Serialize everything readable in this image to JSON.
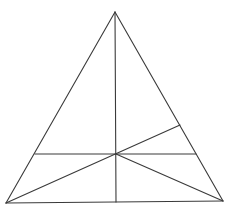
{
  "figure": {
    "stroke_color": "#3a3a3a",
    "background_color": "#ffffff",
    "points": {
      "apex": [
        115,
        12
      ],
      "bottom_left": [
        6,
        203
      ],
      "bottom_right": [
        223,
        201
      ],
      "center": [
        116,
        154
      ],
      "vertical_foot": [
        116,
        202
      ],
      "horizontal_left": [
        35,
        154
      ],
      "horizontal_right": [
        196,
        154
      ],
      "upper_right_on_side": [
        180,
        125
      ]
    },
    "segments": [
      {
        "name": "left-side",
        "from": "apex",
        "to": "bottom_left"
      },
      {
        "name": "right-side",
        "from": "apex",
        "to": "bottom_right"
      },
      {
        "name": "base",
        "from": "bottom_left",
        "to": "bottom_right"
      },
      {
        "name": "vertical-median",
        "from": "apex",
        "to": "vertical_foot"
      },
      {
        "name": "horizontal-segment",
        "from": "horizontal_left",
        "to": "horizontal_right"
      },
      {
        "name": "diagonal-bottom-left-to-right-side",
        "from": "bottom_left",
        "to": "upper_right_on_side"
      },
      {
        "name": "diagonal-center-to-bottom-right",
        "from": "center",
        "to": "bottom_right"
      }
    ]
  },
  "captions": {
    "top": "",
    "bottom": ""
  }
}
